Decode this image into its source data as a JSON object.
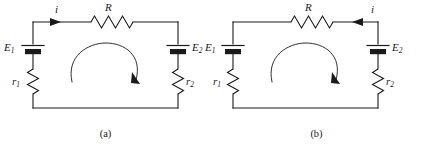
{
  "figure": {
    "type": "circuit-diagram-pair",
    "background_color": "#ffffff",
    "line_color": "#1a1a1a",
    "panels": [
      {
        "id": "a",
        "caption": "(a)",
        "current_label": "i",
        "current_direction": "right",
        "loop_direction": "clockwise",
        "components": {
          "resistor_top": {
            "label": "R",
            "orientation": "horizontal",
            "position": "top-wire-center"
          },
          "battery_left": {
            "label": "E",
            "subscript": "1",
            "orientation": "vertical",
            "position": "left-branch"
          },
          "battery_right": {
            "label": "E",
            "subscript": "2",
            "orientation": "vertical",
            "position": "right-branch"
          },
          "resistor_left": {
            "label": "r",
            "subscript": "1",
            "orientation": "vertical",
            "position": "left-branch-lower"
          },
          "resistor_right": {
            "label": "r",
            "subscript": "2",
            "orientation": "vertical",
            "position": "right-branch-lower"
          }
        }
      },
      {
        "id": "b",
        "caption": "(b)",
        "current_label": "i",
        "current_direction": "left",
        "loop_direction": "clockwise",
        "components": {
          "resistor_top": {
            "label": "R",
            "orientation": "horizontal",
            "position": "top-wire-center"
          },
          "battery_left": {
            "label": "E",
            "subscript": "1",
            "orientation": "vertical",
            "position": "left-branch"
          },
          "battery_right": {
            "label": "E",
            "subscript": "2",
            "orientation": "vertical",
            "position": "right-branch"
          },
          "resistor_left": {
            "label": "r",
            "subscript": "1",
            "orientation": "vertical",
            "position": "left-branch-lower"
          },
          "resistor_right": {
            "label": "r",
            "subscript": "2",
            "orientation": "vertical",
            "position": "right-branch-lower"
          }
        }
      }
    ]
  },
  "panel_a": {
    "caption": "(a)",
    "current": "i",
    "resistor_r": "R",
    "emf_1_base": "E",
    "emf_1_sub": "1",
    "emf_2_base": "E",
    "emf_2_sub": "2",
    "res_1_base": "r",
    "res_1_sub": "1",
    "res_2_base": "r",
    "res_2_sub": "2"
  },
  "panel_b": {
    "caption": "(b)",
    "current": "i",
    "resistor_r": "R",
    "emf_1_base": "E",
    "emf_1_sub": "1",
    "emf_2_base": "E",
    "emf_2_sub": "2",
    "res_1_base": "r",
    "res_1_sub": "1",
    "res_2_base": "r",
    "res_2_sub": "2"
  }
}
